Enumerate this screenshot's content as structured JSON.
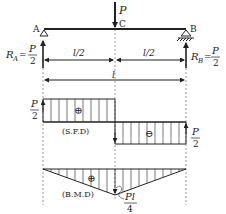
{
  "beam": {
    "load_label": "P",
    "point_a": "A",
    "point_b": "B",
    "point_c": "C",
    "half_span_left": "l/2",
    "half_span_right": "l/2",
    "span": "l"
  },
  "reactions": {
    "ra_symbol": "R",
    "ra_sub": "A",
    "rb_symbol": "R",
    "rb_sub": "B",
    "eq": "=",
    "num": "P",
    "den": "2"
  },
  "sfd": {
    "title": "(S.F.D)",
    "positive_sign": "⊕",
    "negative_sign": "⊖",
    "left_value_num": "P",
    "left_value_den": "2",
    "right_value_num": "P",
    "right_value_den": "2"
  },
  "bmd": {
    "title": "(B.M.D)",
    "positive_sign": "⊕",
    "max_num": "Pl",
    "max_den": "4"
  },
  "colors": {
    "ink": "#222222",
    "background": "#ffffff"
  }
}
